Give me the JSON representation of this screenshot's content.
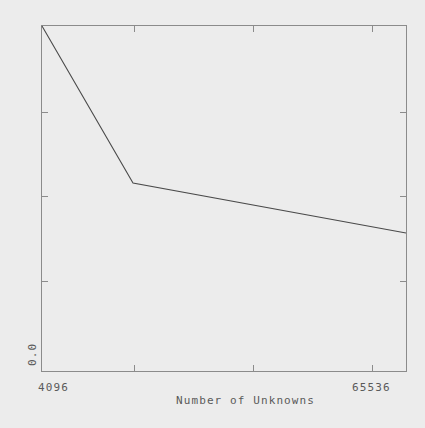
{
  "chart_data": {
    "type": "line",
    "title": "",
    "subtitle": "",
    "xlabel": "Number of Unknowns",
    "ylabel": "Scaled Time",
    "x_tick_labels": [
      "4096",
      "65536"
    ],
    "y_tick_labels": [
      "0.0"
    ],
    "x_scale": "log2",
    "xlim": [
      4096,
      65536
    ],
    "ylim": [
      0.0,
      1.0
    ],
    "grid": false,
    "legend": null,
    "series": [
      {
        "name": "Scaled Time",
        "x": [
          4096,
          8192,
          65536
        ],
        "y": [
          1.0,
          0.545,
          0.4
        ]
      }
    ],
    "annotations": []
  },
  "axes": {
    "y_axis_title": "Scaled Time",
    "y_zero_label": "0.0",
    "x_axis_title": "Number of Unknowns",
    "x_min_label": "4096",
    "x_max_label": "65536"
  }
}
